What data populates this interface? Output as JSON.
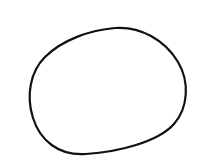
{
  "canvas": {
    "background": "#ffffff",
    "width": 200,
    "height": 160
  },
  "shape": {
    "type": "closed-blob",
    "stroke_color": "#111111",
    "stroke_width": 2.2,
    "fill": "none",
    "path": "M 115 28 C 140 26 165 40 178 62 C 190 82 188 108 174 124 C 158 142 118 152 86 154 C 58 156 40 140 33 118 C 26 96 30 72 45 57 C 62 40 90 30 115 28 Z"
  }
}
